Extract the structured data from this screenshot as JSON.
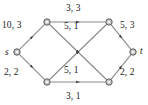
{
  "figure": {
    "type": "flow-network-diagram",
    "colors": {
      "edge": "#8a8a8a",
      "arrow": "#3a3a3a",
      "node_fill": "#c9c9c9",
      "node_stroke": "#4a4a4a",
      "text": "#1a1a1a",
      "background": "#ffffff"
    }
  },
  "nodes": [
    {
      "id": "s",
      "name": "source-node",
      "label": "s",
      "x": 17,
      "y": 52
    },
    {
      "id": "u1",
      "name": "top-left-node",
      "label": "",
      "x": 47,
      "y": 22
    },
    {
      "id": "u2",
      "name": "top-right-node",
      "label": "",
      "x": 109,
      "y": 22
    },
    {
      "id": "v1",
      "name": "bottom-left-node",
      "label": "",
      "x": 47,
      "y": 82
    },
    {
      "id": "v2",
      "name": "bottom-right-node",
      "label": "",
      "x": 109,
      "y": 82
    },
    {
      "id": "t",
      "name": "sink-node",
      "label": "t",
      "x": 133,
      "y": 52
    }
  ],
  "edges": [
    {
      "name": "edge-s-to-top-left",
      "from": "s",
      "to": "u1",
      "label": "10, 3",
      "capacity": 10,
      "flow": 3,
      "label_x": 2,
      "label_y": 21
    },
    {
      "name": "edge-s-to-bottom-left",
      "from": "s",
      "to": "v1",
      "label": "2, 2",
      "capacity": 2,
      "flow": 2,
      "label_x": 4,
      "label_y": 68
    },
    {
      "name": "edge-top-left-to-top-right",
      "from": "u1",
      "to": "u2",
      "label": "3, 3",
      "capacity": 3,
      "flow": 3,
      "label_x": 66,
      "label_y": 4
    },
    {
      "name": "edge-top-left-to-bottom-right",
      "from": "u1",
      "to": "v2",
      "label": "5, 1",
      "capacity": 5,
      "flow": 1,
      "label_x": 64,
      "label_y": 22
    },
    {
      "name": "edge-bottom-left-to-top-right",
      "from": "v1",
      "to": "u2",
      "label": "5, 1",
      "capacity": 5,
      "flow": 1,
      "label_x": 64,
      "label_y": 66
    },
    {
      "name": "edge-bottom-left-to-bottom-right",
      "from": "v1",
      "to": "v2",
      "label": "3, 1",
      "capacity": 3,
      "flow": 1,
      "label_x": 66,
      "label_y": 92
    },
    {
      "name": "edge-top-right-to-t",
      "from": "u2",
      "to": "t",
      "label": "5, 3",
      "capacity": 5,
      "flow": 3,
      "label_x": 120,
      "label_y": 21
    },
    {
      "name": "edge-bottom-right-to-t",
      "from": "v2",
      "to": "t",
      "label": "2, 2",
      "capacity": 2,
      "flow": 2,
      "label_x": 120,
      "label_y": 68
    }
  ],
  "node_labels": [
    {
      "name": "source-label",
      "text": "s",
      "x": 5,
      "y": 48
    },
    {
      "name": "sink-label",
      "text": "t",
      "x": 140,
      "y": 47
    }
  ]
}
